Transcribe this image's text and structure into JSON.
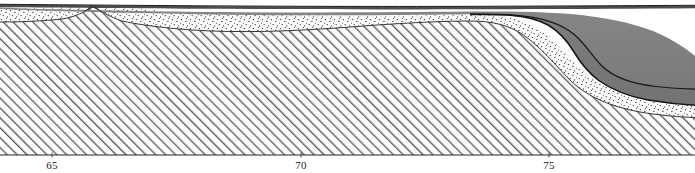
{
  "figure": {
    "type": "geologic-cross-section",
    "width": 695,
    "height": 173,
    "background": "#ffffff",
    "datum_line_y": 155
  },
  "axis": {
    "name": "distance-axis",
    "orientation": "horizontal",
    "baseline_y": 155,
    "tick_label_y": 160,
    "ticks": [
      {
        "label": "65",
        "x": 52
      },
      {
        "label": "70",
        "x": 301
      },
      {
        "label": "75",
        "x": 549
      }
    ],
    "tick_color": "#1b1b1b"
  },
  "colors": {
    "outline": "#1a1a1a",
    "thin_outline": "#2a2a2a",
    "gray_unit": "#7d7d7d",
    "gray_unit_upper": "#7f7f7f",
    "gray_unit_lower": "#767676",
    "top_dark_band": "#4a4a4a",
    "stipple_fill": "#fbfbfb",
    "stipple_dot": "#2e2e2e",
    "hatch_fill": "#fdfdfd",
    "hatch_line": "#5a5a5a",
    "baseline": "#2a2a2a",
    "paper": "#ffffff"
  },
  "units": [
    {
      "name": "hatched-basement-unit",
      "pattern": "diagonal-hatch",
      "angle_deg": 45,
      "description": "lower hatched unit forming a broad arch with a small cusp near x=93 and a steep right-hand flank descending between x=520 and x=640"
    },
    {
      "name": "stippled-sand-unit",
      "pattern": "stipple-dots",
      "description": "dotted unit draping the hatched unit; thick at left, pinches out near x=280, thickens strongly to the right"
    },
    {
      "name": "gray-unit-lower",
      "pattern": "solid-gray",
      "description": "lower solid gray wedge, present only right of about x=500, thickening to the right margin"
    },
    {
      "name": "gray-unit-upper",
      "pattern": "solid-gray",
      "description": "upper solid gray wedge above an internal contact line, present right of about x=470"
    },
    {
      "name": "top-dark-band",
      "pattern": "thin-dark-band",
      "description": "thin dark seafloor / surface band running the full width along the top"
    }
  ]
}
